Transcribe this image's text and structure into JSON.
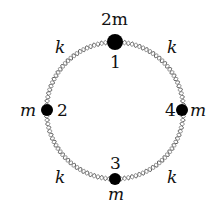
{
  "diagram": {
    "masses": [
      {
        "index": "1",
        "mass_label": "2m",
        "position": "top"
      },
      {
        "index": "2",
        "mass_label": "m",
        "position": "left"
      },
      {
        "index": "3",
        "mass_label": "m",
        "position": "bottom"
      },
      {
        "index": "4",
        "mass_label": "m",
        "position": "right"
      }
    ],
    "springs": [
      {
        "label": "k",
        "position": "top-left"
      },
      {
        "label": "k",
        "position": "top-right"
      },
      {
        "label": "k",
        "position": "bottom-left"
      },
      {
        "label": "k",
        "position": "bottom-right"
      }
    ]
  }
}
